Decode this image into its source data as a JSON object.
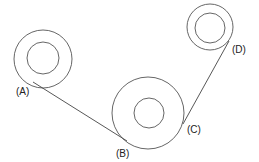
{
  "diagram": {
    "pulleys": [
      {
        "id": "left-pulley",
        "name": "upper-left pulley"
      },
      {
        "id": "bottom-pulley",
        "name": "bottom-center pulley"
      },
      {
        "id": "right-pulley",
        "name": "upper-right pulley"
      }
    ],
    "belt_segments": [
      {
        "id": "segment-ab",
        "from": "A",
        "to": "B"
      },
      {
        "id": "segment-cd",
        "from": "C",
        "to": "D"
      }
    ],
    "labels": {
      "a": "(A)",
      "b": "(B)",
      "c": "(C)",
      "d": "(D)"
    },
    "colors": {
      "stroke": "#555555",
      "text": "#222222",
      "background": "#ffffff"
    }
  }
}
